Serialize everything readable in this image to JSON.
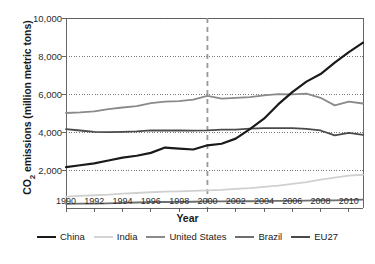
{
  "chart_data": {
    "type": "line",
    "title": "",
    "xlabel": "Year",
    "ylabel": "CO2 emissions (million metric tons)",
    "ylabel_parts": {
      "pre": "CO",
      "sub": "2",
      "post": " emissions (million metric tons)"
    },
    "x": [
      1990,
      1991,
      1992,
      1993,
      1994,
      1995,
      1996,
      1997,
      1998,
      1999,
      2000,
      2001,
      2002,
      2003,
      2004,
      2005,
      2006,
      2007,
      2008,
      2009,
      2010,
      2011
    ],
    "xlim": [
      1990,
      2011
    ],
    "ylim": [
      0,
      10000
    ],
    "yticks": [
      2000,
      4000,
      6000,
      8000,
      10000
    ],
    "ytick_labels": [
      "2,000",
      "4,000",
      "6,000",
      "8,000",
      "10,000"
    ],
    "xticks": [
      1990,
      1992,
      1994,
      1996,
      1998,
      2000,
      2002,
      2004,
      2006,
      2008,
      2010
    ],
    "xtick_labels": [
      "1990",
      "1992",
      "1994",
      "1996",
      "1998",
      "2000",
      "2002",
      "2004",
      "2006",
      "2008",
      "2010"
    ],
    "grid": "horizontal-dotted",
    "legend_position": "bottom",
    "annotations": [
      {
        "type": "vertical-dashed-line",
        "x": 2000,
        "label": ""
      }
    ],
    "series": [
      {
        "name": "China",
        "color": "#1a1a1a",
        "width": 2.2,
        "values": [
          2150,
          2250,
          2350,
          2500,
          2650,
          2750,
          2900,
          3180,
          3130,
          3080,
          3300,
          3380,
          3650,
          4150,
          4700,
          5450,
          6100,
          6650,
          7050,
          7650,
          8200,
          8700
        ]
      },
      {
        "name": "India",
        "color": "#d0d0d0",
        "width": 1.8,
        "values": [
          600,
          640,
          670,
          700,
          760,
          790,
          830,
          860,
          880,
          900,
          930,
          950,
          1010,
          1050,
          1110,
          1180,
          1270,
          1360,
          1490,
          1600,
          1700,
          1750
        ]
      },
      {
        "name": "United States",
        "color": "#8a8a8a",
        "width": 1.8,
        "values": [
          5000,
          5030,
          5090,
          5200,
          5290,
          5360,
          5520,
          5600,
          5630,
          5700,
          5900,
          5760,
          5800,
          5840,
          5930,
          5990,
          5980,
          6020,
          5800,
          5400,
          5600,
          5500
        ]
      },
      {
        "name": "Brazil",
        "color": "#6e6e6e",
        "width": 1.8,
        "values": [
          220,
          230,
          235,
          245,
          270,
          290,
          305,
          315,
          325,
          330,
          345,
          350,
          355,
          355,
          365,
          370,
          375,
          390,
          410,
          405,
          430,
          440
        ]
      },
      {
        "name": "EU27",
        "color": "#4a4a4a",
        "width": 1.8,
        "values": [
          4150,
          4080,
          4010,
          3990,
          4010,
          4030,
          4090,
          4080,
          4080,
          4070,
          4090,
          4130,
          4120,
          4180,
          4200,
          4200,
          4200,
          4160,
          4080,
          3820,
          3950,
          3850
        ]
      }
    ]
  },
  "legend": {
    "items": [
      {
        "label": "China",
        "color": "#1a1a1a",
        "width": "2.4px"
      },
      {
        "label": "India",
        "color": "#d4d4d4",
        "width": "2.2px"
      },
      {
        "label": "United States",
        "color": "#8a8a8a",
        "width": "2.2px"
      },
      {
        "label": "Brazil",
        "color": "#6e6e6e",
        "width": "2.2px"
      },
      {
        "label": "EU27",
        "color": "#4a4a4a",
        "width": "2.2px"
      }
    ]
  },
  "footer": {
    "partial_text": ""
  }
}
